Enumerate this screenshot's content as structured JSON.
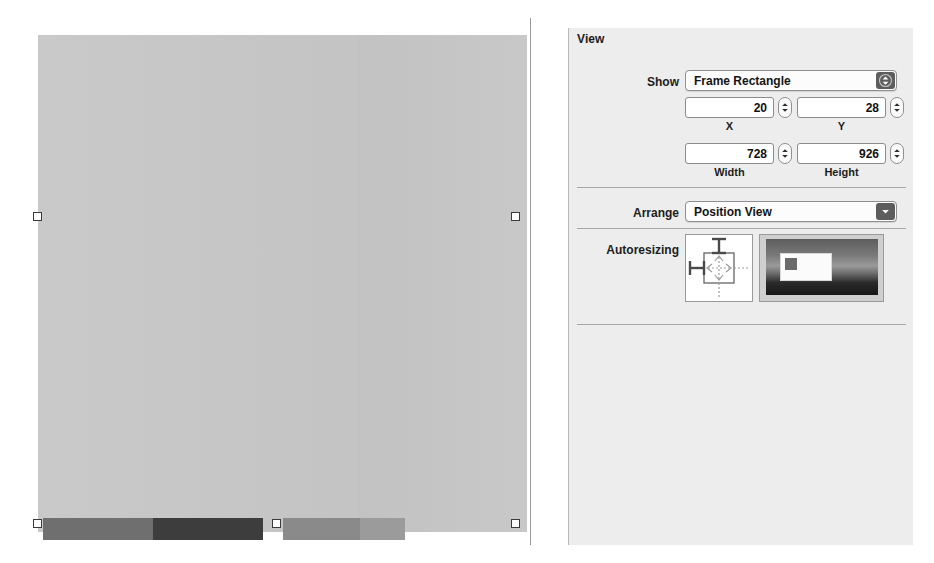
{
  "inspector": {
    "title": "View",
    "show": {
      "label": "Show",
      "value": "Frame Rectangle",
      "icon": "up-down-chevron-icon"
    },
    "geometry": {
      "x": {
        "value": "20",
        "label": "X"
      },
      "y": {
        "value": "28",
        "label": "Y"
      },
      "width": {
        "value": "728",
        "label": "Width"
      },
      "height": {
        "value": "926",
        "label": "Height"
      }
    },
    "arrange": {
      "label": "Arrange",
      "value": "Position View",
      "icon": "chevron-down-icon"
    },
    "autoresizing": {
      "label": "Autoresizing",
      "struts": {
        "top": true,
        "left": true,
        "right": false,
        "bottom": false
      },
      "springs": {
        "horizontal": true,
        "vertical": true
      }
    }
  },
  "canvas": {
    "selection_handles": 6
  },
  "colors": {
    "panel_background": "#ededed",
    "canvas_background": "#c6c6c6",
    "separator": "#a7a7a7",
    "popup_knob": "#5d5d5d",
    "handle_border": "#3a3a3a"
  }
}
